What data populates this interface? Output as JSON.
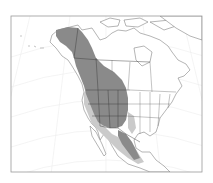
{
  "map": {
    "region": "North America",
    "projection": "conic",
    "frame": {
      "x": 11,
      "y": 16,
      "width": 191,
      "height": 156
    },
    "legend_colors": {
      "primary_range": "#8a8a8a",
      "peripheral_range": "#cacaca",
      "land": "#ffffff",
      "borders": "#6a6a6a",
      "graticule": "#ececec"
    },
    "range_areas": [
      {
        "name": "primary-range",
        "label": "Primary range",
        "color": "#8a8a8a"
      },
      {
        "name": "peripheral-range",
        "label": "Peripheral range",
        "color": "#cacaca"
      }
    ]
  }
}
